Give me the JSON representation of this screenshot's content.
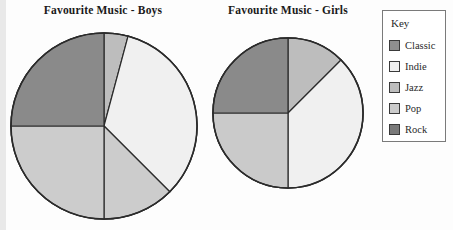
{
  "legend": {
    "title": "Key",
    "items": [
      {
        "label": "Classic",
        "color": "#8f8f8f"
      },
      {
        "label": "Indie",
        "color": "#f0f0f0"
      },
      {
        "label": "Jazz",
        "color": "#bdbdbd"
      },
      {
        "label": "Pop",
        "color": "#cccccc"
      },
      {
        "label": "Rock",
        "color": "#7a7a7a"
      }
    ]
  },
  "chart_data": [
    {
      "type": "pie",
      "title": "Favourite Music - Boys",
      "categories": [
        "Jazz",
        "Indie",
        "Pop",
        "Classic",
        "Rock"
      ],
      "values": [
        15,
        120,
        45,
        90,
        90
      ],
      "unit": "degrees",
      "colors": [
        "#bdbdbd",
        "#f0f0f0",
        "#cccccc",
        "#cccccc",
        "#8a8a8a"
      ],
      "start_angle": 0,
      "direction": "clockwise",
      "legend_position": "right",
      "grid": false
    },
    {
      "type": "pie",
      "title": "Favourite Music - Girls",
      "categories": [
        "Jazz",
        "Indie",
        "Pop",
        "Rock"
      ],
      "values": [
        45,
        135,
        90,
        90
      ],
      "unit": "degrees",
      "colors": [
        "#bdbdbd",
        "#f0f0f0",
        "#cacaca",
        "#8a8a8a"
      ],
      "start_angle": 0,
      "direction": "clockwise",
      "legend_position": "right",
      "grid": false
    }
  ]
}
